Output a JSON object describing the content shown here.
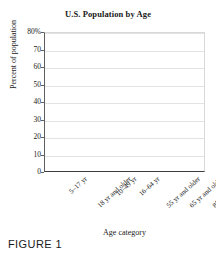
{
  "figure": {
    "caption": "FIGURE 1"
  },
  "chart_data": {
    "type": "bar",
    "title": "U.S. Population by Age",
    "xlabel": "Age category",
    "ylabel": "Percent of population",
    "categories": [
      "5–17 yr",
      "18 yr and older",
      "10–49 yr",
      "16–64 yr",
      "55 yr and older",
      "65 yr and older",
      "85 yr and older"
    ],
    "values": [
      null,
      null,
      null,
      null,
      null,
      null,
      null
    ],
    "ylim": [
      0,
      80
    ],
    "yticks": [
      0,
      10,
      20,
      30,
      40,
      50,
      60,
      70,
      80
    ],
    "ytick_labels": [
      "0",
      "10",
      "20",
      "30",
      "40",
      "50",
      "60",
      "70",
      "80%"
    ],
    "grid": "horizontal",
    "legend": "none",
    "note": "Empty plot template — no bars drawn"
  },
  "colors": {
    "gridline": "#e3e3e3",
    "axis": "#3d3d3d",
    "text": "#1a1a1a",
    "plot_background": "#ffffff"
  }
}
